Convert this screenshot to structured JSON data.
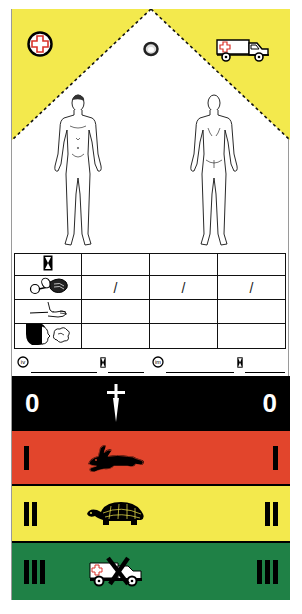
{
  "tag": {
    "colors": {
      "yellow": "#f3e94d",
      "black": "#000000",
      "red": "#e2452c",
      "green": "#1f8146",
      "cross_red": "#d9332a"
    },
    "header": {
      "left_icon": "red-cross-circle-icon",
      "right_icon": "ambulance-icon",
      "center_icon": "eyelet-hole-icon"
    },
    "body_diagrams": [
      {
        "name": "front-body-figure"
      },
      {
        "name": "back-body-figure"
      }
    ],
    "vitals_table": {
      "row_icons": [
        "hourglass-time-icon",
        "blood-pressure-cuff-icon",
        "pulse-hand-icon",
        "breathing-face-icon"
      ],
      "rows": [
        [
          "",
          "",
          ""
        ],
        [
          "/",
          "/",
          "/"
        ],
        [
          "",
          "",
          ""
        ],
        [
          "",
          "",
          ""
        ]
      ]
    },
    "medication_line": {
      "iv_label": "iv",
      "im_label": "im",
      "iv_value": "",
      "iv_time": "",
      "im_value": "",
      "im_time": ""
    },
    "triage_bands": [
      {
        "category": "0",
        "label_left": "0",
        "label_right": "0",
        "icon": "dagger-cross-icon",
        "meaning": "deceased"
      },
      {
        "category": "I",
        "bars": 1,
        "icon": "rabbit-icon",
        "meaning": "immediate"
      },
      {
        "category": "II",
        "bars": 2,
        "icon": "turtle-icon",
        "meaning": "delayed"
      },
      {
        "category": "III",
        "bars": 3,
        "icon": "crossed-ambulance-icon",
        "meaning": "minor"
      }
    ]
  }
}
